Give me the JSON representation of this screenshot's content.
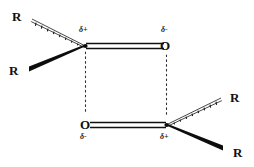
{
  "figure": {
    "background_color": "#ffffff",
    "bond_color": "#111111",
    "dotted_line_color": "#333333"
  },
  "molecules": {
    "top": {
      "carbon_substituents": {
        "upper_left_r": "R",
        "lower_left_r": "R"
      },
      "carbon_charge": "δ+",
      "oxygen_label": "O",
      "oxygen_charge": "δ-"
    },
    "bottom": {
      "carbon_substituents": {
        "upper_right_r": "R",
        "lower_right_r": "R"
      },
      "carbon_charge": "δ+",
      "oxygen_label": "O",
      "oxygen_charge": "δ-"
    }
  },
  "bonds": {
    "top_double_bond": "C=O",
    "bottom_double_bond": "O=C",
    "hashed_wedge_style": "hashed-wedge-back",
    "solid_wedge_style": "solid-wedge-front"
  },
  "interactions": {
    "left_dotted": "delta-plus to delta-minus attraction",
    "right_dotted": "delta-minus to delta-plus attraction"
  }
}
